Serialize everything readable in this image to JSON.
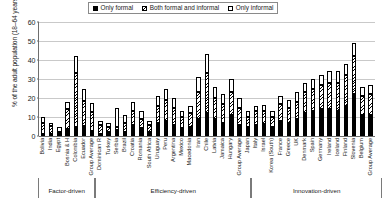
{
  "chart": {
    "type": "bar",
    "title": "",
    "ylabel": "% of the adult population (18–64 years)",
    "xlabel": ""
  },
  "legend": {
    "position": "top-center",
    "items": [
      {
        "label": "Only formal",
        "swatch": "solid-black-swatch",
        "color": "#000000"
      },
      {
        "label": "Both formal and informal",
        "swatch": "hatched-swatch",
        "color": "#000000"
      },
      {
        "label": "Only informal",
        "swatch": "white-swatch",
        "color": "#ffffff"
      }
    ]
  },
  "yaxis": {
    "ticks": [
      "0",
      "10",
      "20",
      "30",
      "40",
      "50",
      "60"
    ],
    "min": 0,
    "max": 60
  },
  "groups": [
    {
      "name": "Factor-driven",
      "count": 7
    },
    {
      "name": "Efficiency-driven",
      "count": 19
    },
    {
      "name": "Innovation-driven",
      "count": 16
    }
  ],
  "chart_data": {
    "type": "bar",
    "stacked": true,
    "title": "",
    "xlabel": "",
    "ylabel": "% of the adult population (18–64 years)",
    "ylim": [
      0,
      60
    ],
    "grid": true,
    "legend_position": "top-center",
    "categories": [
      "Bolivia",
      "India",
      "Egypt",
      "Bosnia & H",
      "Colombia",
      "Ecuador",
      "Group Average",
      "Dominican R",
      "Turkey",
      "Serbia",
      "Brazil",
      "Croatia",
      "Romania",
      "South Africa",
      "Uruguay",
      "Peru",
      "Argentina",
      "Mexico",
      "Macedonia",
      "Iran",
      "Chile",
      "Latvia",
      "Jamaica",
      "Hungary",
      "Group Average",
      "Japan",
      "Italy",
      "Israel",
      "Korea (South)",
      "France",
      "Greece",
      "UK",
      "Denmark",
      "Spain",
      "Germany",
      "Ireland",
      "Iceland",
      "Finland",
      "Slovenia",
      "Belgium",
      "Group Average"
    ],
    "series": [
      {
        "name": "Only formal",
        "values": [
          1.0,
          0.6,
          0.8,
          3.5,
          5.0,
          5.5,
          2.8,
          1.0,
          2.0,
          3.0,
          2.0,
          6.0,
          4.0,
          2.0,
          7.0,
          8.0,
          6.0,
          4.0,
          5.0,
          9.0,
          12.0,
          9.0,
          7.0,
          11.0,
          6.0,
          5.0,
          6.0,
          6.5,
          5.0,
          8.0,
          7.0,
          9.0,
          12.0,
          13.0,
          14.0,
          14.0,
          13.0,
          16.0,
          22.0,
          11.0,
          11.0
        ]
      },
      {
        "name": "Both formal and informal",
        "values": [
          6.0,
          4.0,
          1.0,
          10.5,
          28.0,
          13.0,
          10.0,
          5.0,
          3.0,
          1.5,
          5.0,
          7.0,
          5.0,
          4.0,
          9.0,
          11.0,
          9.0,
          6.0,
          7.0,
          14.0,
          21.0,
          11.0,
          10.0,
          12.0,
          9.0,
          5.0,
          7.0,
          6.5,
          5.0,
          9.0,
          8.0,
          9.0,
          11.0,
          12.0,
          13.0,
          14.0,
          15.0,
          16.0,
          20.0,
          10.0,
          11.0
        ]
      },
      {
        "name": "Only informal",
        "values": [
          3.0,
          2.0,
          2.5,
          4.0,
          9.0,
          6.0,
          4.5,
          2.0,
          2.0,
          10.0,
          4.0,
          5.0,
          4.0,
          2.0,
          5.0,
          6.0,
          5.0,
          3.0,
          4.0,
          8.0,
          10.0,
          6.0,
          5.0,
          7.0,
          5.0,
          3.0,
          3.0,
          3.5,
          3.0,
          4.0,
          4.0,
          5.0,
          5.0,
          5.0,
          5.0,
          6.0,
          6.0,
          6.0,
          7.0,
          5.0,
          5.0
        ]
      }
    ]
  }
}
